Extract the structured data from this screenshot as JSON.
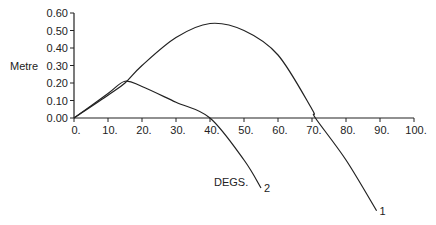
{
  "chart_data": {
    "type": "line",
    "title": "",
    "xlabel": "DEGS.",
    "ylabel": "Metre",
    "xlim": [
      0,
      100
    ],
    "ylim": [
      0,
      0.6
    ],
    "grid": false,
    "x_ticks": [
      "0.",
      "10.",
      "20.",
      "30.",
      "40.",
      "50.",
      "60.",
      "70.",
      "80.",
      "90.",
      "100."
    ],
    "y_ticks": [
      "0.00",
      "0.10",
      "0.20",
      "0.30",
      "0.40",
      "0.50",
      "0.60"
    ],
    "series": [
      {
        "name": "1",
        "x": [
          0,
          10,
          15,
          20,
          30,
          40,
          50,
          60,
          70,
          71,
          80,
          89
        ],
        "values": [
          0.0,
          0.13,
          0.2,
          0.3,
          0.46,
          0.54,
          0.5,
          0.36,
          0.05,
          0.0,
          -0.24,
          -0.53
        ]
      },
      {
        "name": "2",
        "x": [
          0,
          10,
          15,
          20,
          30,
          40,
          50,
          55
        ],
        "values": [
          0.0,
          0.14,
          0.21,
          0.18,
          0.09,
          0.0,
          -0.24,
          -0.4
        ]
      }
    ],
    "annotations": [
      "1",
      "2"
    ],
    "color": "#222222"
  }
}
